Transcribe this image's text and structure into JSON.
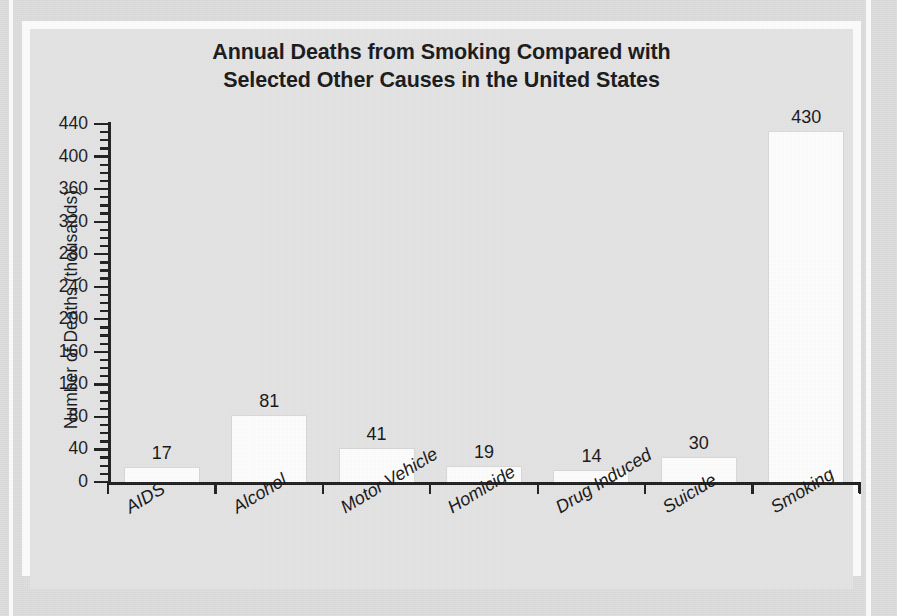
{
  "chart_data": {
    "type": "bar",
    "title": "Annual Deaths from Smoking Compared with Selected Other Causes in the United States",
    "title_lines": [
      "Annual Deaths from Smoking Compared with",
      "Selected Other Causes in the United States"
    ],
    "xlabel": "",
    "ylabel": "Number of Deaths (thousands)",
    "categories": [
      "AIDS",
      "Alcohol",
      "Motor Vehicle",
      "Homicide",
      "Drug Induced",
      "Suicide",
      "Smoking"
    ],
    "values": [
      17,
      81,
      41,
      19,
      14,
      30,
      430
    ],
    "value_labels": [
      "17",
      "81",
      "41",
      "19",
      "14",
      "30",
      "430"
    ],
    "ylim": [
      0,
      440
    ],
    "ytick_values": [
      0,
      40,
      80,
      120,
      160,
      200,
      240,
      280,
      320,
      360,
      400,
      440
    ],
    "ytick_labels": [
      "0",
      "40",
      "80",
      "120",
      "160",
      "200",
      "240",
      "280",
      "320",
      "360",
      "400",
      "440"
    ],
    "yminor_step": 10,
    "grid": false,
    "legend": null,
    "legend_position": "none",
    "bar_color": "#fdfdfd",
    "axis_color": "#1b1b1b",
    "plot_background": "#e3e3e3",
    "page_background": "#dcdcdc",
    "frame_color": "#fcfcfc"
  }
}
